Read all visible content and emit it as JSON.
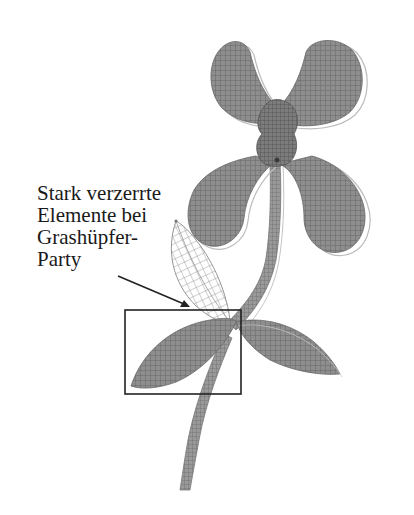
{
  "annotation": {
    "lines": [
      "Stark verzerrte",
      "Elemente bei",
      "Grashüpfer-",
      "Party"
    ]
  },
  "colors": {
    "mesh_fill": "#8e8e8e",
    "mesh_line": "#5a5a5a",
    "undeformed_outline": "#b5b5b5",
    "box": "#222222",
    "arrow": "#222222",
    "text": "#1a1a1a",
    "background": "#ffffff"
  },
  "highlight_box": {
    "x": 125,
    "y": 310,
    "width": 116,
    "height": 84
  },
  "arrow": {
    "x1": 118,
    "y1": 276,
    "x2": 188,
    "y2": 306
  }
}
